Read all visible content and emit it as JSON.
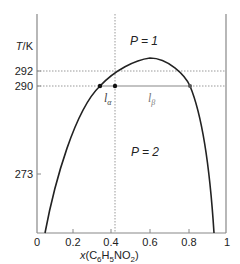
{
  "chart_data": {
    "type": "line",
    "title": "",
    "xlabel": "x(C6H5NO2)",
    "xlabel_parts": {
      "pre": "x(C",
      "sub1": "6",
      "mid": "H",
      "sub2": "5",
      "post": "NO",
      "sub3": "2",
      "end": ")"
    },
    "ylabel": "T/K",
    "ylabel_parts": {
      "t": "T",
      "slash": "/K"
    },
    "xlim": [
      0,
      1
    ],
    "x_ticks": [
      "0",
      "0.2",
      "0.4",
      "0.6",
      "0.8",
      "1"
    ],
    "y_ticks": [
      "292",
      "290",
      "273"
    ],
    "grid": false,
    "series": [
      {
        "name": "phase boundary",
        "x": [
          0.04,
          0.1,
          0.2,
          0.3,
          0.34,
          0.4,
          0.5,
          0.6,
          0.7,
          0.8,
          0.83,
          0.9,
          0.95
        ],
        "y": [
          270,
          277,
          285,
          289,
          290,
          291.2,
          292.3,
          293,
          292.4,
          290.5,
          290,
          283,
          270
        ]
      }
    ],
    "annotations": {
      "region_upper": "P = 1",
      "region_lower": "P = 2",
      "tie_line_T": 290,
      "tie_line_x_alpha": 0.34,
      "tie_line_x_overall": 0.41,
      "tie_line_x_beta": 0.83,
      "reference_T_dotted": 292,
      "lever_alpha_label": "l",
      "lever_alpha_sub": "α",
      "lever_beta_label": "l",
      "lever_beta_sub": "β"
    }
  }
}
